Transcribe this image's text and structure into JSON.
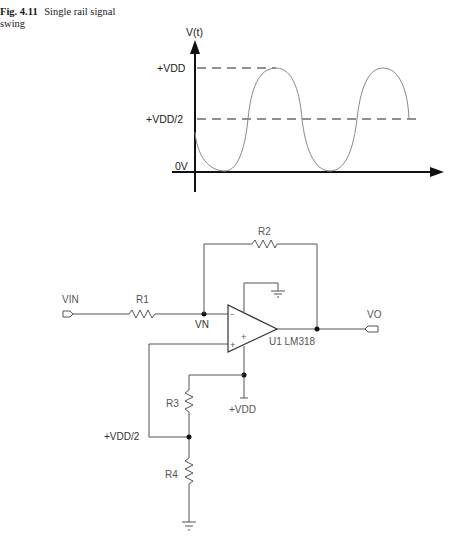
{
  "caption": {
    "figure_number": "Fig. 4.11",
    "text": "Single rail signal swing"
  },
  "waveform": {
    "y_axis_label": "V(t)",
    "levels": {
      "vdd": "+VDD",
      "half_vdd": "+VDD/2",
      "zero": "0V"
    }
  },
  "circuit": {
    "input_port": "VIN",
    "output_port": "VO",
    "resistors": {
      "r1": "R1",
      "r2": "R2",
      "r3": "R3",
      "r4": "R4"
    },
    "node_vn": "VN",
    "opamp_label": "U1 LM318",
    "opamp_minus": "−",
    "opamp_plus": "+",
    "supply_plus_pin": "+",
    "vdd_terminal": "+VDD",
    "half_vdd_node": "+VDD/2"
  }
}
